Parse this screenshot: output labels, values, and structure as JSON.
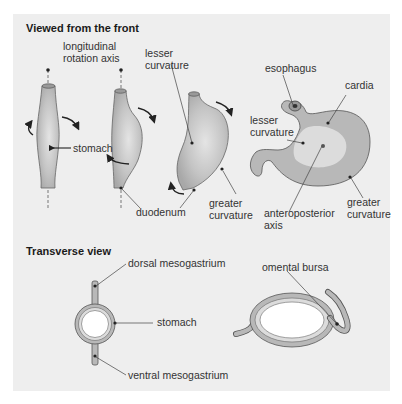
{
  "sections": {
    "front": {
      "title": "Viewed from the front"
    },
    "transverse": {
      "title": "Transverse view"
    }
  },
  "labels": {
    "rotation_axis": "longitudinal\nrotation axis",
    "stomach_stage1": "stomach",
    "lesser_curvature_stage3": "lesser\ncurvature",
    "duodenum": "duodenum",
    "greater_curvature_stage3": "greater\ncurvature",
    "esophagus": "esophagus",
    "cardia": "cardia",
    "lesser_curvature_stage4": "lesser\ncurvature",
    "anteroposterior_axis": "anteroposterior\naxis",
    "greater_curvature_stage4": "greater\ncurvature",
    "dorsal_mesogastrium": "dorsal mesogastrium",
    "stomach_transverse": "stomach",
    "ventral_mesogastrium": "ventral mesogastrium",
    "omental_bursa": "omental bursa"
  },
  "colors": {
    "panel_bg": "#eeeeee",
    "organ_fill": "#b8b8b8",
    "organ_highlight": "#dcdcdc",
    "outline": "#555555",
    "text": "#333333"
  }
}
